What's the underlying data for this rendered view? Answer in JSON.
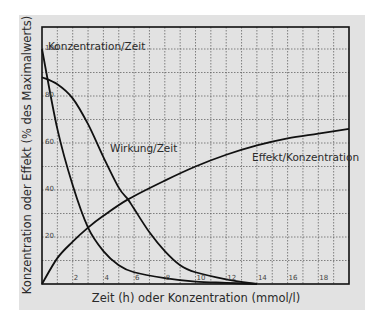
{
  "chart_data": {
    "type": "line",
    "title": "",
    "xlabel": "Zeit (h) oder Konzentration (mmol/l)",
    "ylabel": "Konzentration oder Effekt (% des Maximalwerts)",
    "xlim": [
      0,
      20
    ],
    "ylim": [
      0,
      109
    ],
    "x_ticks": [
      2,
      4,
      6,
      8,
      10,
      12,
      14,
      16,
      18
    ],
    "y_ticks": [
      20,
      40,
      60,
      80,
      100
    ],
    "grid": true,
    "legend": "inline labels",
    "series": [
      {
        "name": "Konzentration/Zeit",
        "x": [
          0,
          1,
          2,
          3,
          4,
          5,
          6,
          8,
          10,
          12,
          14
        ],
        "values": [
          100,
          66,
          42,
          24,
          14,
          8,
          5,
          2.5,
          1,
          0.5,
          0
        ]
      },
      {
        "name": "Wirkung/Zeit",
        "x": [
          0,
          1,
          2,
          3,
          4,
          5,
          5.6,
          6,
          7,
          8,
          9,
          10,
          12,
          14
        ],
        "values": [
          88,
          85,
          79,
          68,
          54,
          41,
          36,
          32,
          22,
          14,
          8,
          5,
          2,
          0
        ]
      },
      {
        "name": "Effekt/Konzentration",
        "x": [
          0,
          1,
          2,
          3,
          4,
          5.6,
          8,
          10,
          12,
          14,
          16,
          18,
          20
        ],
        "values": [
          0,
          11,
          18,
          24,
          29,
          36,
          44,
          50,
          55,
          59,
          62,
          64,
          66
        ]
      }
    ]
  },
  "labels": {
    "xlabel": "Zeit (h) oder Konzentration (mmol/l)",
    "ylabel": "Konzentration oder Effekt (% des Maximalwerts)",
    "series": [
      "Konzentration/Zeit",
      "Wirkung/Zeit",
      "Effekt/Konzentration"
    ],
    "yticks": [
      "100",
      "80",
      "60",
      "40",
      "20"
    ],
    "xticks": [
      "2",
      "4",
      "6",
      "8",
      "10",
      "12",
      "14",
      "16",
      "18"
    ]
  },
  "colors": {
    "panel": "#e2e2e2",
    "curve": "#111111",
    "grid": "#555555",
    "text": "#2a2a2a"
  }
}
